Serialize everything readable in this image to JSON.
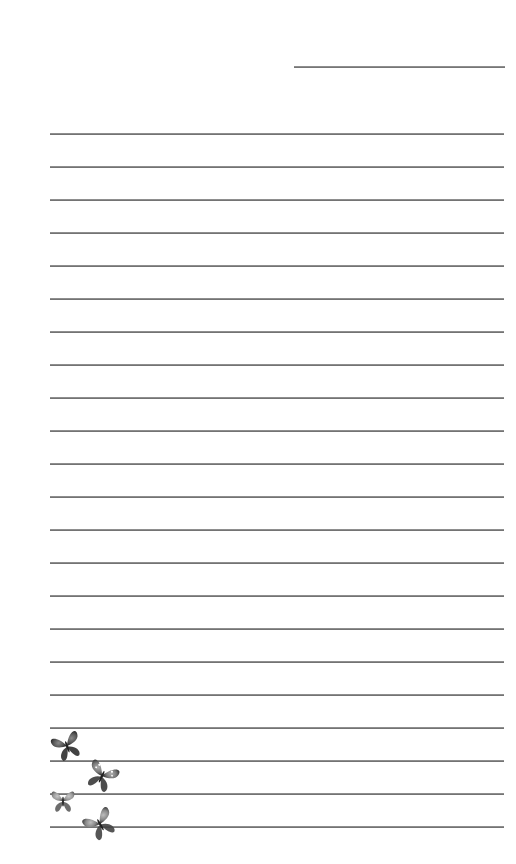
{
  "page": {
    "type": "lined-stationery",
    "background": "#ffffff",
    "line_color": "#6b6b6b",
    "date_line": {
      "x": 294,
      "y": 66,
      "width": 211
    },
    "ruled_lines": {
      "count": 22,
      "start_y": 133,
      "spacing": 33,
      "x": 50,
      "width": 454
    }
  },
  "decorations": [
    {
      "name": "butterfly-icon",
      "x": 50,
      "y": 728,
      "w": 34,
      "h": 36,
      "rot": -20,
      "tone": "dark"
    },
    {
      "name": "butterfly-icon",
      "x": 84,
      "y": 758,
      "w": 36,
      "h": 36,
      "rot": 25,
      "tone": "spotted"
    },
    {
      "name": "butterfly-icon",
      "x": 47,
      "y": 787,
      "w": 32,
      "h": 28,
      "rot": 0,
      "tone": "light"
    },
    {
      "name": "butterfly-icon",
      "x": 82,
      "y": 805,
      "w": 36,
      "h": 38,
      "rot": -30,
      "tone": "medium"
    }
  ]
}
